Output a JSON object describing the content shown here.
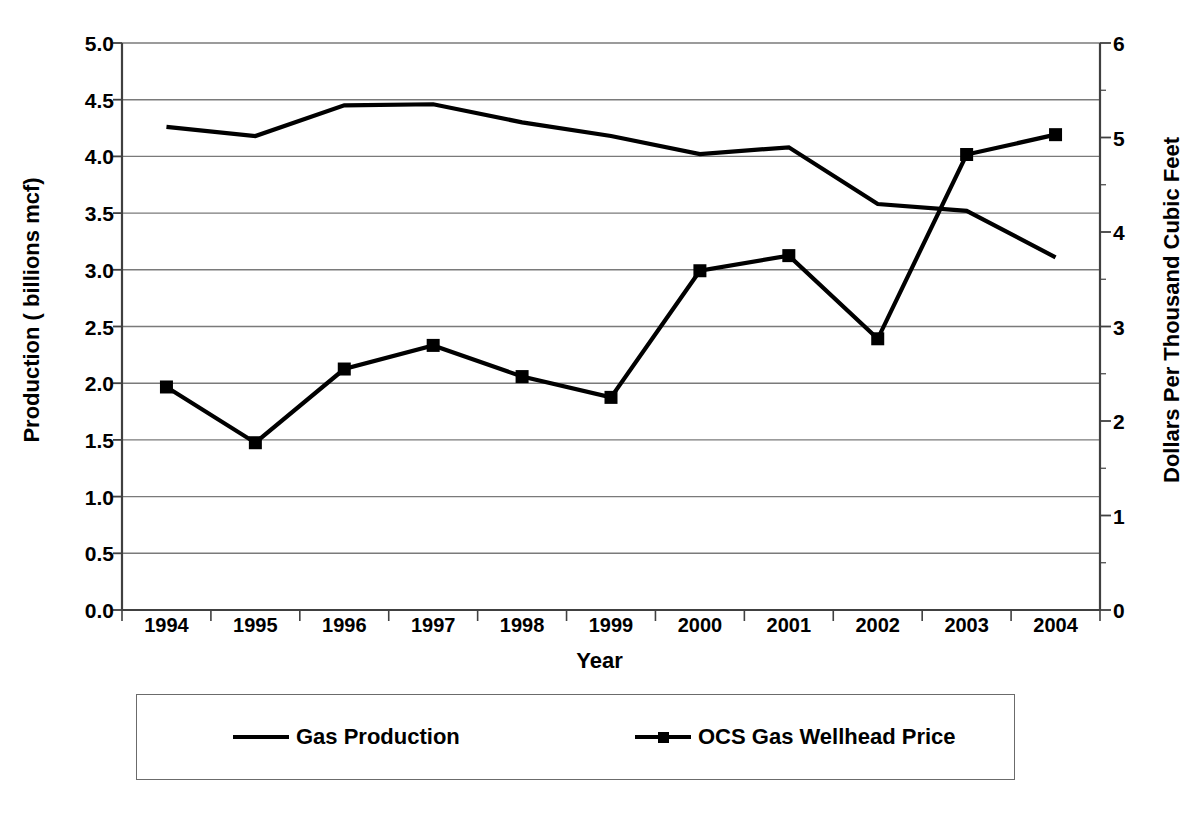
{
  "chart_data": {
    "type": "line",
    "title": "",
    "xlabel": "Year",
    "categories": [
      "1994",
      "1995",
      "1996",
      "1997",
      "1998",
      "1999",
      "2000",
      "2001",
      "2002",
      "2003",
      "2004"
    ],
    "grid": true,
    "legend_position": "bottom",
    "axes": {
      "left": {
        "label": "Production ( billions mcf)",
        "ticks": [
          "0.0",
          "0.5",
          "1.0",
          "1.5",
          "2.0",
          "2.5",
          "3.0",
          "3.5",
          "4.0",
          "4.5",
          "5.0"
        ],
        "tick_values": [
          0.0,
          0.5,
          1.0,
          1.5,
          2.0,
          2.5,
          3.0,
          3.5,
          4.0,
          4.5,
          5.0
        ],
        "min": 0.0,
        "max": 5.0
      },
      "right": {
        "label": "Dollars Per Thousand Cubic Feet",
        "ticks": [
          "0",
          "1",
          "2",
          "3",
          "4",
          "5",
          "6"
        ],
        "tick_values": [
          0,
          1,
          2,
          3,
          4,
          5,
          6
        ],
        "min": 0,
        "max": 6
      }
    },
    "series": [
      {
        "name": "Gas Production",
        "axis": "left",
        "marker": "none",
        "color": "#000000",
        "values": [
          4.26,
          4.18,
          4.45,
          4.46,
          4.3,
          4.18,
          4.02,
          4.08,
          3.58,
          3.52,
          3.11
        ]
      },
      {
        "name": "OCS Gas Wellhead Price",
        "axis": "right",
        "marker": "square",
        "color": "#000000",
        "values": [
          2.36,
          1.77,
          2.55,
          2.8,
          2.47,
          2.25,
          3.59,
          3.75,
          2.87,
          4.82,
          5.03
        ]
      }
    ]
  },
  "legend": {
    "entries": [
      {
        "label": "Gas Production",
        "marker": "none"
      },
      {
        "label": "OCS Gas Wellhead Price",
        "marker": "square"
      }
    ]
  },
  "colors": {
    "series": "#000000",
    "gridline": "#7a7a7a",
    "axis": "#404040",
    "background": "#ffffff",
    "legend_border": "#6b6b6b"
  }
}
